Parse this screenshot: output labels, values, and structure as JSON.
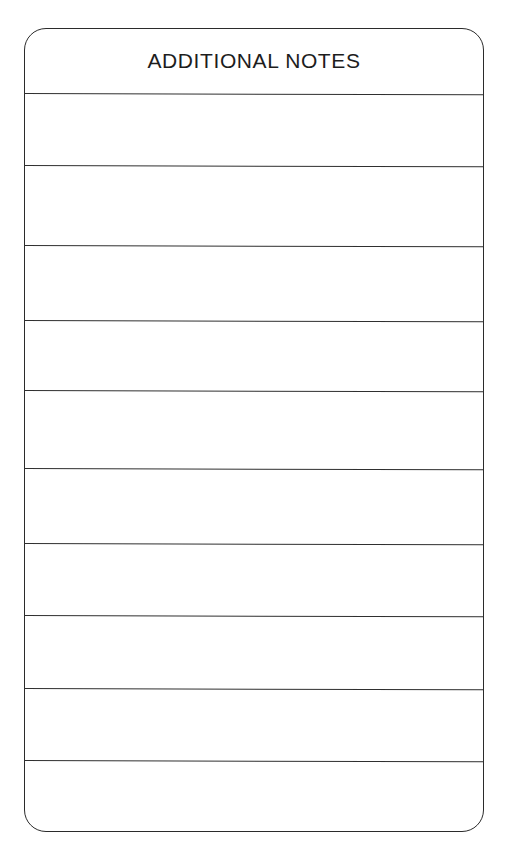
{
  "document": {
    "type": "form-section",
    "background_color": "#ffffff",
    "ink_color": "#2b2b2b"
  },
  "form": {
    "title": "ADDITIONAL NOTES",
    "border_color": "#2b2b2b",
    "corner_radius_px": 22,
    "header_height_px": 65,
    "rule_color": "#2f2f2f",
    "row_count": 9,
    "rows": [
      {
        "index": 1,
        "value": ""
      },
      {
        "index": 2,
        "value": ""
      },
      {
        "index": 3,
        "value": ""
      },
      {
        "index": 4,
        "value": ""
      },
      {
        "index": 5,
        "value": ""
      },
      {
        "index": 6,
        "value": ""
      },
      {
        "index": 7,
        "value": ""
      },
      {
        "index": 8,
        "value": ""
      },
      {
        "index": 9,
        "value": ""
      }
    ],
    "rule_y_positions": [
      93,
      165,
      245,
      320,
      390,
      468,
      543,
      615,
      688,
      760
    ],
    "geometry": {
      "left_px": 24,
      "top_px": 28,
      "width_px": 460,
      "height_px": 804
    }
  }
}
